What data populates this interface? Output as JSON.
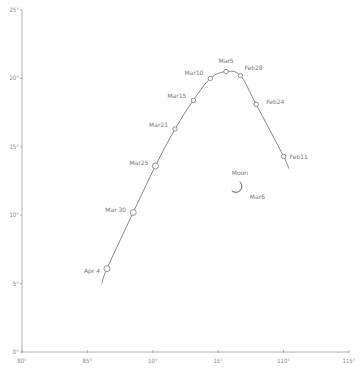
{
  "chart_data": {
    "type": "line",
    "title": "",
    "xlabel": "",
    "ylabel": "",
    "xlim": [
      80,
      105
    ],
    "ylim": [
      0,
      25
    ],
    "grid": false,
    "legend": null,
    "x_ticks": [
      {
        "value": 80,
        "label": "80°"
      },
      {
        "value": 85,
        "label": "85°"
      },
      {
        "value": 90,
        "label": "10°"
      },
      {
        "value": 95,
        "label": "15°"
      },
      {
        "value": 100,
        "label": "110°"
      },
      {
        "value": 105,
        "label": "115°"
      }
    ],
    "y_ticks": [
      {
        "value": 0,
        "label": "0°"
      },
      {
        "value": 5,
        "label": "5°"
      },
      {
        "value": 10,
        "label": "10°"
      },
      {
        "value": 15,
        "label": "15°"
      },
      {
        "value": 20,
        "label": "20°"
      },
      {
        "value": 25,
        "label": "25°"
      }
    ],
    "series": [
      {
        "name": "Comet path",
        "line_start": {
          "x": 86.1,
          "y": 5.0
        },
        "line_end": {
          "x": 100.4,
          "y": 13.4
        },
        "points": [
          {
            "label": "Apr 4",
            "x": 86.5,
            "y": 6.1
          },
          {
            "label": "Mar 30",
            "x": 88.5,
            "y": 10.2
          },
          {
            "label": "Mar25",
            "x": 90.2,
            "y": 13.6
          },
          {
            "label": "Mar21",
            "x": 91.7,
            "y": 16.3
          },
          {
            "label": "Mar15",
            "x": 93.1,
            "y": 18.4
          },
          {
            "label": "Mar10",
            "x": 94.4,
            "y": 20.0
          },
          {
            "label": "Mar5",
            "x": 95.6,
            "y": 20.5
          },
          {
            "label": "Feb28",
            "x": 96.7,
            "y": 20.2
          },
          {
            "label": "Feb24",
            "x": 97.9,
            "y": 18.1
          },
          {
            "label": "Feb11",
            "x": 100.0,
            "y": 14.3
          }
        ]
      }
    ],
    "annotations": [
      {
        "type": "moon",
        "label": "Moon",
        "date_label": "Mar6",
        "x": 96.5,
        "y": 12.0
      }
    ]
  }
}
